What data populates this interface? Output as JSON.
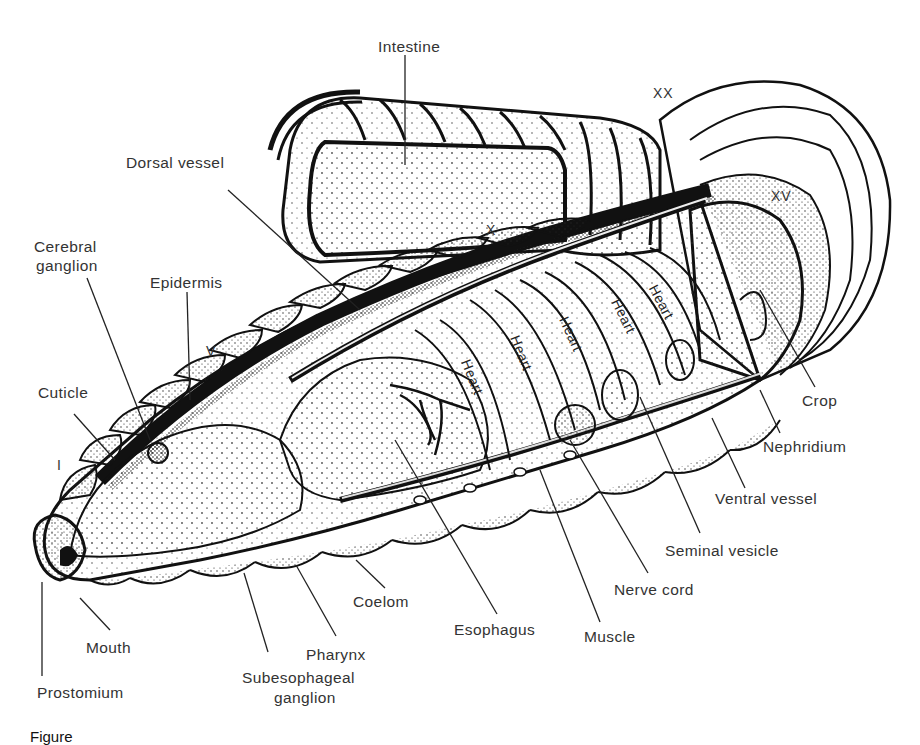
{
  "figure": {
    "caption_visible": "Figure"
  },
  "labels": {
    "intestine": "Intestine",
    "dorsal_vessel": "Dorsal vessel",
    "cerebral_ganglion_line1": "Cerebral",
    "cerebral_ganglion_line2": "ganglion",
    "epidermis": "Epidermis",
    "cuticle": "Cuticle",
    "mouth": "Mouth",
    "prostomium": "Prostomium",
    "subesophageal_ganglion_line1": "Subesophageal",
    "subesophageal_ganglion_line2": "ganglion",
    "pharynx": "Pharynx",
    "coelom": "Coelom",
    "esophagus": "Esophagus",
    "muscle": "Muscle",
    "nerve_cord": "Nerve cord",
    "seminal_vesicle": "Seminal vesicle",
    "ventral_vessel": "Ventral vessel",
    "nephridium": "Nephridium",
    "crop": "Crop"
  },
  "segment_numerals": {
    "i": "I",
    "v": "V",
    "x": "X",
    "xv": "XV",
    "xx": "XX"
  },
  "hearts": [
    "Heart",
    "Heart",
    "Heart",
    "Heart",
    "Heart"
  ],
  "colors": {
    "ink": "#111111",
    "label_text": "#333333",
    "background": "#ffffff"
  }
}
